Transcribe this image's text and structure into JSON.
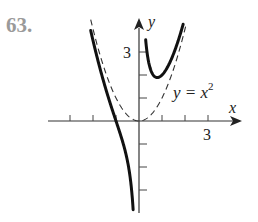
{
  "problem": {
    "number": "63."
  },
  "chart_data": {
    "type": "line",
    "title": "",
    "xlabel": "x",
    "ylabel": "y",
    "x_tick_label": "3",
    "y_tick_label": "3",
    "x_ticks": [
      -3,
      -2,
      -1,
      1,
      2,
      3
    ],
    "y_ticks": [
      -3,
      -2,
      -1,
      1,
      2,
      3
    ],
    "xlim": [
      -4.2,
      4.4
    ],
    "ylim": [
      -4.0,
      4.4
    ],
    "grid": false,
    "series": [
      {
        "name": "y = x^2 + 1/x",
        "style": "solid-bold",
        "branches": [
          {
            "domain": [
              -2.1,
              -0.255
            ],
            "description": "left branch, crosses x-axis at x = -1, descends to -infinity as x -> 0-"
          },
          {
            "domain": [
              0.29,
              1.92
            ],
            "description": "right branch, local minimum near (0.79, 1.89)"
          }
        ]
      },
      {
        "name": "y = x^2",
        "style": "dashed",
        "label": "y = x",
        "label_sup": "2",
        "domain": [
          -2.1,
          2.05
        ]
      }
    ],
    "annotations": [
      {
        "text": "y = x²",
        "near": [
          1.45,
          1.2
        ]
      }
    ]
  },
  "colors": {
    "curve": "#111111",
    "dashed": "#333333",
    "axis": "#333333",
    "number": "#9a9a9a"
  }
}
